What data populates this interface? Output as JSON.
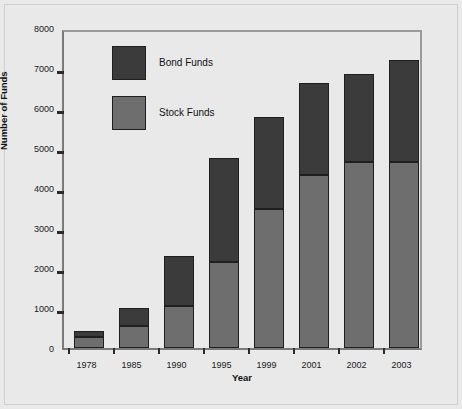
{
  "chart_data": {
    "type": "bar",
    "subtype": "stacked-bar",
    "title": "",
    "xlabel": "Year",
    "ylabel": "Number of Funds",
    "categories": [
      "1978",
      "1985",
      "1990",
      "1995",
      "1999",
      "2001",
      "2002",
      "2003"
    ],
    "series": [
      {
        "name": "Stock Funds",
        "color": "#6e6e6e",
        "values": [
          270,
          540,
          1060,
          2160,
          3480,
          4330,
          4660,
          4640
        ]
      },
      {
        "name": "Bond Funds",
        "color": "#3b3b3b",
        "values": [
          145,
          465,
          1240,
          2590,
          2300,
          2300,
          2200,
          2560
        ]
      }
    ],
    "totals": [
      415,
      1005,
      2300,
      4750,
      5780,
      6630,
      6860,
      7200
    ],
    "ylim": [
      0,
      8000
    ],
    "yticks": [
      0,
      1000,
      2000,
      3000,
      4000,
      5000,
      6000,
      7000,
      8000
    ],
    "ytick_labels": [
      "0",
      "1000",
      "2000",
      "3000",
      "4000",
      "5000",
      "6000",
      "7000",
      "8000"
    ],
    "grid": false,
    "legend_position": "upper-left-inside",
    "legend": [
      {
        "label": "Bond Funds",
        "color": "#3b3b3b"
      },
      {
        "label": "Stock Funds",
        "color": "#6e6e6e"
      }
    ]
  },
  "figure": {
    "background": "#e9e9e9",
    "axis_color": "#7a7a7a"
  }
}
